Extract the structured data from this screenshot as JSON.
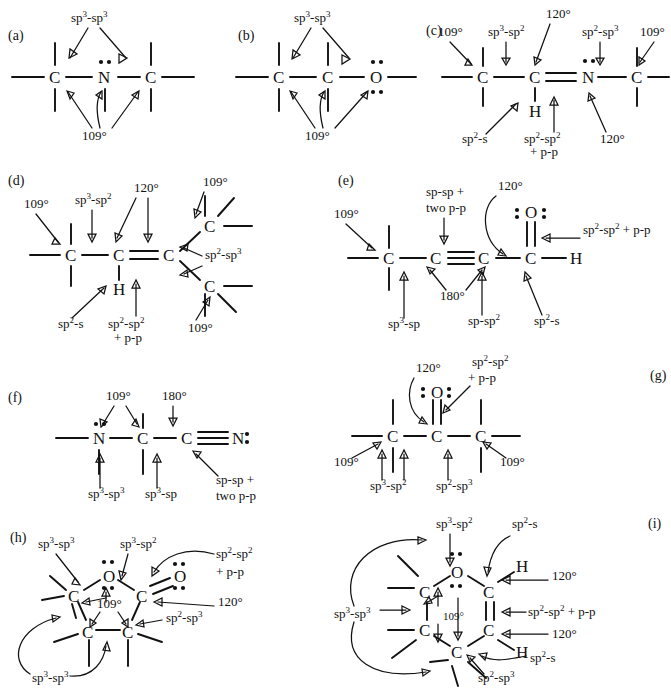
{
  "figure": {
    "type": "chemical-structure-diagram",
    "panel_count": 9
  },
  "panels": [
    {
      "id": "a",
      "tag": "(a)",
      "backbone": [
        "C",
        "N",
        "C"
      ],
      "lone_pairs": {
        "N": 2
      },
      "labels": [
        "sp3-sp3",
        "109°"
      ],
      "label_text": {
        "top": "sp",
        "top_sup": "3",
        "top_mid": "-sp",
        "top_sup2": "3",
        "bottom": "109°"
      }
    },
    {
      "id": "b",
      "tag": "(b)",
      "backbone": [
        "C",
        "C",
        "O"
      ],
      "lone_pairs": {
        "O": 4
      },
      "labels": [
        "sp3-sp3",
        "109°"
      ]
    },
    {
      "id": "c",
      "tag": "(c)",
      "backbone": [
        "C",
        "C",
        "N",
        "C"
      ],
      "double_bond": "C=N",
      "lone_pairs": {
        "N": 2
      },
      "hydrogen": "H",
      "labels": [
        "109°",
        "sp3-sp2",
        "120°",
        "sp2-sp3",
        "109°",
        "sp2-s",
        "sp2-sp2 + p-p",
        "120°"
      ]
    },
    {
      "id": "d",
      "tag": "(d)",
      "backbone": [
        "C",
        "C",
        "C"
      ],
      "branches": [
        "C",
        "C"
      ],
      "double_bond": "C=C",
      "hydrogen": "H",
      "labels": [
        "109°",
        "sp3-sp2",
        "120°",
        "109°",
        "sp2-sp3",
        "109°",
        "sp2-s",
        "sp2-sp2 + p-p"
      ]
    },
    {
      "id": "e",
      "tag": "(e)",
      "backbone": [
        "C",
        "C",
        "C",
        "C",
        "H"
      ],
      "triple_bond": "C≡C",
      "carbonyl": "O",
      "lone_pairs": {
        "O": 4
      },
      "labels": [
        "109°",
        "sp-sp + two p-p",
        "120°",
        "sp2-sp2 + p-p",
        "180°",
        "sp3-sp",
        "sp-sp2",
        "sp2-s"
      ]
    },
    {
      "id": "f",
      "tag": "(f)",
      "backbone": [
        "N",
        "C",
        "C",
        "N"
      ],
      "triple_bond": "C≡N",
      "lone_pairs": {
        "N1": 2,
        "N2": 2
      },
      "labels": [
        "109°",
        "180°",
        "sp3-sp3",
        "sp3-sp",
        "sp-sp + two p-p"
      ]
    },
    {
      "id": "g",
      "tag": "(g)",
      "backbone": [
        "C",
        "C",
        "C"
      ],
      "carbonyl": "O",
      "lone_pairs": {
        "O": 4
      },
      "labels": [
        "120°",
        "sp2-sp2 + p-p",
        "109°",
        "109°",
        "sp3-sp2",
        "sp2-sp3"
      ]
    },
    {
      "id": "h",
      "tag": "(h)",
      "ring": [
        "O",
        "C",
        "C",
        "C",
        "C"
      ],
      "ring_size": 5,
      "carbonyl": "O",
      "lone_pairs": {
        "O_ring": 4,
        "O_carbonyl": 4
      },
      "labels": [
        "sp3-sp3",
        "sp3-sp2",
        "sp2-sp2 + p-p",
        "120°",
        "sp2-sp3",
        "109°",
        "sp3-sp3"
      ]
    },
    {
      "id": "i",
      "tag": "(i)",
      "ring": [
        "O",
        "C",
        "C",
        "C",
        "C",
        "C"
      ],
      "ring_size": 6,
      "double_bond": "C=C",
      "lone_pairs": {
        "O": 4
      },
      "hydrogens": [
        "H",
        "H"
      ],
      "labels": [
        "sp3-sp2",
        "sp2-s",
        "120°",
        "sp2-sp2 + p-p",
        "120°",
        "sp3-sp3",
        "109°",
        "sp2-sp3",
        "sp2-s"
      ]
    }
  ],
  "text": {
    "tag_a": "(a)",
    "tag_b": "(b)",
    "tag_c": "(c)",
    "tag_d": "(d)",
    "tag_e": "(e)",
    "tag_f": "(f)",
    "tag_g": "(g)",
    "tag_h": "(h)",
    "tag_i": "(i)",
    "atom_C": "C",
    "atom_N": "N",
    "atom_O": "O",
    "atom_H": "H",
    "ang109": "109°",
    "ang120": "120°",
    "ang180": "180°",
    "sp3sp3": "sp3-sp3",
    "sp3sp2": "sp3-sp2",
    "sp2sp3": "sp2-sp3",
    "sp2sp2": "sp2-sp2",
    "sp2s": "sp2-s",
    "sp3sp": "sp3-sp",
    "spsp2": "sp-sp2",
    "spsp": "sp-sp",
    "plus_pp": "+ p-p",
    "two_pp": "two p-p",
    "sp2sp2_pp": "sp2-sp2 + p-p",
    "spsp_pp": "sp-sp + two p-p"
  },
  "colors": {
    "ink": "#111111",
    "background": "#ffffff"
  }
}
